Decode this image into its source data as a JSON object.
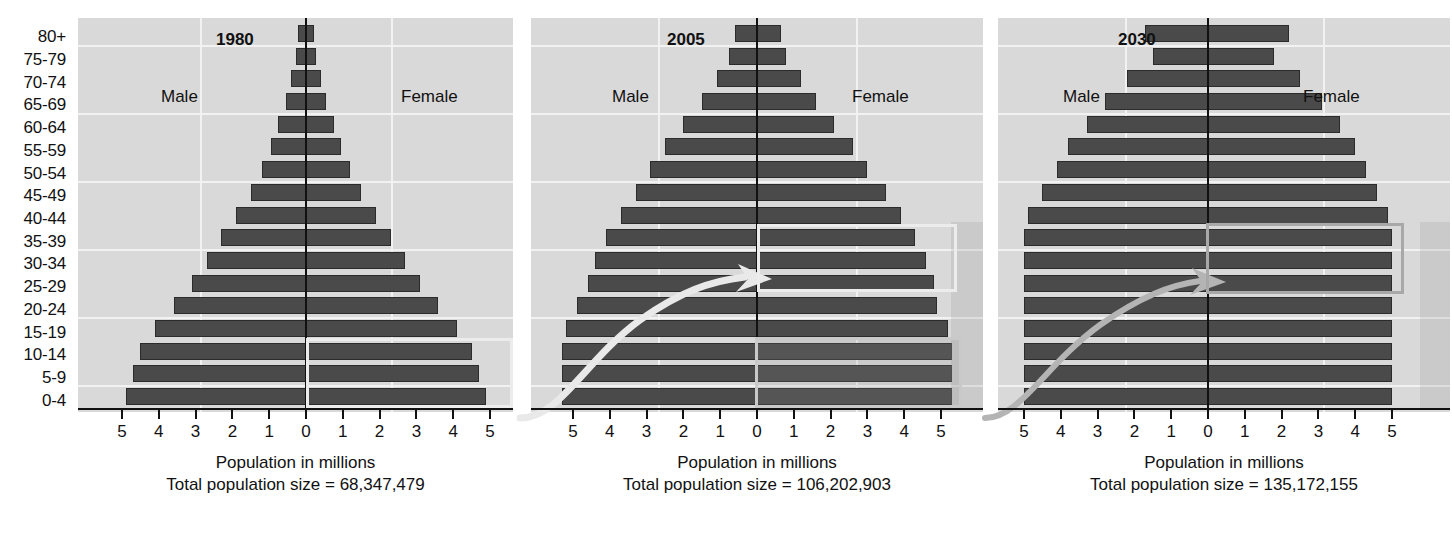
{
  "chart_data": {
    "type": "bar",
    "xlabel": "Population in millions",
    "ylabel": "Age group",
    "grid": true,
    "legend": [
      "Male",
      "Female"
    ],
    "xlim": [
      -5.5,
      5.5
    ],
    "xticks": [
      "5",
      "4",
      "3",
      "2",
      "1",
      "0",
      "1",
      "2",
      "3",
      "4",
      "5"
    ],
    "categories": [
      "0-4",
      "5-9",
      "10-14",
      "15-19",
      "20-24",
      "25-29",
      "30-34",
      "35-39",
      "40-44",
      "45-49",
      "50-54",
      "55-59",
      "60-64",
      "65-69",
      "70-74",
      "75-79",
      "80+"
    ],
    "panels": [
      {
        "title": "1980",
        "total_label": "Total population size = 68,347,479",
        "male": [
          4.9,
          4.7,
          4.5,
          4.1,
          3.6,
          3.1,
          2.7,
          2.3,
          1.9,
          1.5,
          1.2,
          0.95,
          0.75,
          0.55,
          0.4,
          0.27,
          0.22
        ],
        "female": [
          4.9,
          4.7,
          4.5,
          4.1,
          3.6,
          3.1,
          2.7,
          2.3,
          1.9,
          1.5,
          1.2,
          0.95,
          0.75,
          0.55,
          0.4,
          0.27,
          0.22
        ]
      },
      {
        "title": "2005",
        "total_label": "Total population size = 106,202,903",
        "male": [
          5.3,
          5.3,
          5.3,
          5.2,
          4.9,
          4.6,
          4.4,
          4.1,
          3.7,
          3.3,
          2.9,
          2.5,
          2.0,
          1.5,
          1.1,
          0.75,
          0.6
        ],
        "female": [
          5.3,
          5.3,
          5.3,
          5.2,
          4.9,
          4.8,
          4.6,
          4.3,
          3.9,
          3.5,
          3.0,
          2.6,
          2.1,
          1.6,
          1.2,
          0.8,
          0.65
        ]
      },
      {
        "title": "2030",
        "total_label": "Total population size = 135,172,155",
        "male": [
          5.0,
          5.0,
          5.0,
          5.0,
          5.0,
          5.0,
          5.0,
          5.0,
          4.9,
          4.5,
          4.1,
          3.8,
          3.3,
          2.8,
          2.2,
          1.5,
          1.7
        ],
        "female": [
          5.0,
          5.0,
          5.0,
          5.0,
          5.0,
          5.0,
          5.0,
          5.0,
          4.9,
          4.6,
          4.3,
          4.0,
          3.6,
          3.1,
          2.5,
          1.8,
          2.2
        ]
      }
    ],
    "male_label": "Male",
    "female_label": "Female",
    "highlights": [
      {
        "panel": "1980",
        "side": "female",
        "from": "0-4",
        "to": "10-14",
        "style": "white-outline"
      },
      {
        "panel": "2005",
        "side": "female",
        "from": "25-29",
        "to": "35-39",
        "style": "white-outline"
      },
      {
        "panel": "2005",
        "side": "female",
        "from": "0-4",
        "to": "10-14",
        "style": "grey-shaded"
      },
      {
        "panel": "2030",
        "side": "female",
        "from": "25-29",
        "to": "35-39",
        "style": "grey-outline"
      }
    ],
    "annotations": [
      {
        "type": "arrow",
        "from": "1980 0-14 cohort",
        "to": "2005 25-39 cohort"
      },
      {
        "type": "arrow",
        "from": "2005 0-14 cohort",
        "to": "2030 25-39 cohort"
      }
    ]
  },
  "axis": {
    "age_labels": [
      "80+",
      "75-79",
      "70-74",
      "65-69",
      "60-64",
      "55-59",
      "50-54",
      "45-49",
      "40-44",
      "35-39",
      "30-34",
      "25-29",
      "20-24",
      "15-19",
      "10-14",
      "5-9",
      "0-4"
    ],
    "x_tick_labels": [
      "5",
      "4",
      "3",
      "2",
      "1",
      "0",
      "1",
      "2",
      "3",
      "4",
      "5"
    ],
    "x_axis_caption": "Population in millions"
  },
  "colors": {
    "bar": "#4a4a4a",
    "panel_background": "#d9d9d9",
    "gridline": "#f2f2f2",
    "axis": "#111111",
    "highlight_white": "#ececec",
    "highlight_grey": "#a8a8a8"
  },
  "figure_caption": ""
}
